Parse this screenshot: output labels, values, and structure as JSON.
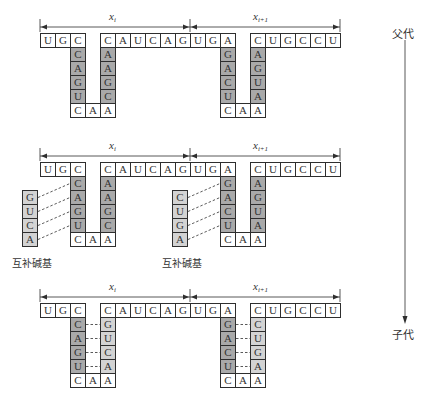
{
  "generation_axis": {
    "top_label": "父代",
    "bottom_label": "子代"
  },
  "segment_labels": {
    "left": {
      "base": "x",
      "sub": "i"
    },
    "right": {
      "base": "x",
      "sub": "i+1"
    }
  },
  "complementary_label": "互补碱基",
  "colors": {
    "stem_dark": "#a9a9a9",
    "stem_light": "#d3d3d3",
    "cell_white": "#ffffff",
    "line": "#2e2e2e"
  },
  "sections": [
    {
      "id": "parent",
      "top_row": [
        "U",
        "G",
        "C",
        null,
        "C",
        "A",
        "U",
        "C",
        "A",
        "G",
        "U",
        "G",
        "A",
        null,
        "C",
        "U",
        "G",
        "C",
        "C",
        "U"
      ],
      "hairpins": [
        {
          "left_stem": [
            "C",
            "A",
            "G",
            "U"
          ],
          "right_stem": [
            "A",
            "A",
            "G",
            "C"
          ],
          "loop": [
            "C",
            "A",
            "A"
          ],
          "right_stem_style": "dark",
          "pairing": "none"
        },
        {
          "left_stem": [
            "G",
            "A",
            "C",
            "U"
          ],
          "right_stem": [
            "A",
            "G",
            "U",
            "A"
          ],
          "loop": [
            "C",
            "A",
            "A"
          ],
          "right_stem_style": "dark",
          "pairing": "none"
        }
      ],
      "complementary_strands": []
    },
    {
      "id": "pairing",
      "top_row": [
        "U",
        "G",
        "C",
        null,
        "C",
        "A",
        "U",
        "C",
        "A",
        "G",
        "U",
        "G",
        "A",
        null,
        "C",
        "U",
        "G",
        "C",
        "C",
        "U"
      ],
      "hairpins": [
        {
          "left_stem": [
            "C",
            "A",
            "G",
            "U"
          ],
          "right_stem": [
            "A",
            "A",
            "G",
            "C"
          ],
          "loop": [
            "C",
            "A",
            "A"
          ],
          "right_stem_style": "dark",
          "pairing": "none"
        },
        {
          "left_stem": [
            "G",
            "A",
            "C",
            "U"
          ],
          "right_stem": [
            "A",
            "G",
            "U",
            "A"
          ],
          "loop": [
            "C",
            "A",
            "A"
          ],
          "right_stem_style": "dark",
          "pairing": "none"
        }
      ],
      "complementary_strands": [
        {
          "bases": [
            "G",
            "U",
            "C",
            "A"
          ],
          "label": "互补碱基"
        },
        {
          "bases": [
            "C",
            "U",
            "G",
            "A"
          ],
          "label": "互补碱基"
        }
      ]
    },
    {
      "id": "child",
      "top_row": [
        "U",
        "G",
        "C",
        null,
        "C",
        "A",
        "U",
        "C",
        "A",
        "G",
        "U",
        "G",
        "A",
        null,
        "C",
        "U",
        "G",
        "C",
        "C",
        "U"
      ],
      "hairpins": [
        {
          "left_stem": [
            "C",
            "A",
            "G",
            "U"
          ],
          "right_stem": [
            "G",
            "U",
            "C",
            "A"
          ],
          "loop": [
            "C",
            "A",
            "A"
          ],
          "right_stem_style": "light",
          "pairing": "dashed"
        },
        {
          "left_stem": [
            "G",
            "A",
            "C",
            "U"
          ],
          "right_stem": [
            "C",
            "U",
            "G",
            "A"
          ],
          "loop": [
            "C",
            "A",
            "A"
          ],
          "right_stem_style": "light",
          "pairing": "dashed"
        }
      ],
      "complementary_strands": []
    }
  ]
}
